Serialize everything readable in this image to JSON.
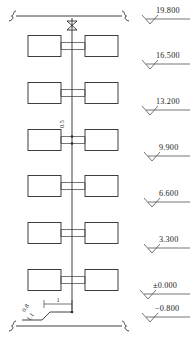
{
  "drawing": {
    "type": "plumbing-riser-diagram",
    "line_color": "#2b2b2b",
    "background": "#ffffff"
  },
  "riser": {
    "valve_name": "gate-valve",
    "vertical_line_x": 72,
    "top_y": 18,
    "bottom_y": 312
  },
  "break_lines": {
    "top": {
      "y": 16,
      "x1": 10,
      "x2": 128
    },
    "bottom": {
      "y": 326,
      "x1": 10,
      "x2": 128
    }
  },
  "floors": [
    {
      "index": 1,
      "y": 46,
      "left_box_label": "",
      "right_box_label": ""
    },
    {
      "index": 2,
      "y": 93,
      "left_box_label": "",
      "right_box_label": ""
    },
    {
      "index": 3,
      "y": 140,
      "left_box_label": "",
      "right_box_label": ""
    },
    {
      "index": 4,
      "y": 186,
      "left_box_label": "",
      "right_box_label": ""
    },
    {
      "index": 5,
      "y": 233,
      "left_box_label": "",
      "right_box_label": ""
    },
    {
      "index": 6,
      "y": 280,
      "left_box_label": "",
      "right_box_label": ""
    }
  ],
  "dimensions": [
    {
      "name": "branch-offset",
      "value": "0.5",
      "x": 64,
      "y": 128,
      "rotation": -90
    },
    {
      "name": "bottom-depth",
      "value": "0.8",
      "x": 28,
      "y": 308,
      "rotation": -55
    },
    {
      "name": "bottom-offset",
      "value": "1.1",
      "x": 33,
      "y": 316,
      "rotation": -55
    },
    {
      "name": "horizontal-run",
      "value": "1",
      "x": 60,
      "y": 302,
      "rotation": 0
    }
  ],
  "elevations": [
    {
      "value": "19.800",
      "y": 13,
      "text_x": 156
    },
    {
      "value": "16.500",
      "y": 58,
      "text_x": 156
    },
    {
      "value": "13.200",
      "y": 104,
      "text_x": 156
    },
    {
      "value": "9.900",
      "y": 150,
      "text_x": 159
    },
    {
      "value": "6.600",
      "y": 196,
      "text_x": 159
    },
    {
      "value": "3.300",
      "y": 242,
      "text_x": 159
    },
    {
      "value": "±0.000",
      "y": 288,
      "text_x": 153
    },
    {
      "value": "−0.800",
      "y": 311,
      "text_x": 155
    }
  ]
}
